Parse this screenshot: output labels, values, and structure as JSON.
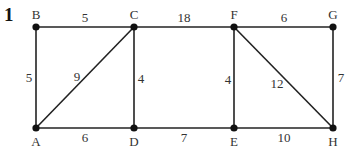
{
  "question_number": "1",
  "graph": {
    "nodes": [
      {
        "id": "A",
        "label": "A",
        "x": 36,
        "y": 128,
        "lx": 36,
        "ly": 146
      },
      {
        "id": "B",
        "label": "B",
        "x": 36,
        "y": 27,
        "lx": 36,
        "ly": 19
      },
      {
        "id": "C",
        "label": "C",
        "x": 134,
        "y": 27,
        "lx": 134,
        "ly": 19
      },
      {
        "id": "D",
        "label": "D",
        "x": 134,
        "y": 128,
        "lx": 134,
        "ly": 146
      },
      {
        "id": "E",
        "label": "E",
        "x": 234,
        "y": 128,
        "lx": 234,
        "ly": 146
      },
      {
        "id": "F",
        "label": "F",
        "x": 234,
        "y": 27,
        "lx": 234,
        "ly": 19
      },
      {
        "id": "G",
        "label": "G",
        "x": 333,
        "y": 27,
        "lx": 333,
        "ly": 19
      },
      {
        "id": "H",
        "label": "H",
        "x": 333,
        "y": 128,
        "lx": 333,
        "ly": 146
      }
    ],
    "edges": [
      {
        "from": "B",
        "to": "C",
        "weight": "5",
        "lx": 85,
        "ly": 22
      },
      {
        "from": "C",
        "to": "F",
        "weight": "18",
        "lx": 184,
        "ly": 22
      },
      {
        "from": "F",
        "to": "G",
        "weight": "6",
        "lx": 284,
        "ly": 22
      },
      {
        "from": "B",
        "to": "A",
        "weight": "5",
        "lx": 29,
        "ly": 82
      },
      {
        "from": "A",
        "to": "C",
        "weight": "9",
        "lx": 77,
        "ly": 81
      },
      {
        "from": "C",
        "to": "D",
        "weight": "4",
        "lx": 141,
        "ly": 83
      },
      {
        "from": "F",
        "to": "E",
        "weight": "4",
        "lx": 228,
        "ly": 84
      },
      {
        "from": "F",
        "to": "H",
        "weight": "12",
        "lx": 277,
        "ly": 88
      },
      {
        "from": "G",
        "to": "H",
        "weight": "7",
        "lx": 341,
        "ly": 82
      },
      {
        "from": "A",
        "to": "D",
        "weight": "6",
        "lx": 85,
        "ly": 142
      },
      {
        "from": "D",
        "to": "E",
        "weight": "7",
        "lx": 184,
        "ly": 142
      },
      {
        "from": "E",
        "to": "H",
        "weight": "10",
        "lx": 284,
        "ly": 142
      }
    ]
  },
  "colors": {
    "edge": "#222222",
    "node": "#111111",
    "label": "#333333"
  }
}
